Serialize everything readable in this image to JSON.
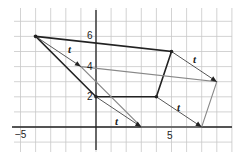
{
  "diagram": {
    "type": "coordinate-grid-translation",
    "grid": {
      "xmin": -5,
      "xmax": 9,
      "ymin": -1,
      "ymax": 7,
      "unit_px": 15.1,
      "origin_px": [
        96,
        127
      ]
    },
    "axis_labels": {
      "x_neg": "−5",
      "x_pos": "5",
      "y_2": "2",
      "y_4": "4",
      "y_6": "6"
    },
    "translation_label": "t",
    "original_shape": [
      [
        -4,
        6
      ],
      [
        5,
        5
      ],
      [
        4,
        2
      ],
      [
        0,
        2
      ]
    ],
    "image_shape": [
      [
        -1,
        4
      ],
      [
        8,
        3
      ],
      [
        7,
        0
      ],
      [
        3,
        0
      ]
    ],
    "colors": {
      "grid": "#c8c8c8",
      "axis": "#222222",
      "original": "#222222",
      "image": "#888888",
      "arrow": "#444444"
    }
  }
}
